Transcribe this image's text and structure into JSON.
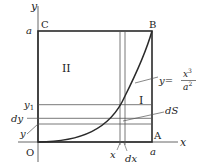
{
  "diagram": {
    "axes": {
      "x_label": "x",
      "y_label": "y",
      "origin_label": "O"
    },
    "points": {
      "A": "A",
      "B": "B",
      "C": "C"
    },
    "tick_labels": {
      "a_x": "a",
      "a_y": "a",
      "x": "x",
      "dx": "dx",
      "y1": "y",
      "y1_sub": "1",
      "dy": "dy",
      "y": "y"
    },
    "regions": {
      "region_1": "I",
      "region_2": "II"
    },
    "annotations": {
      "dS": "dS",
      "curve_lhs": "y=",
      "curve_num": "x",
      "curve_num_exp": "3",
      "curve_den": "a",
      "curve_den_exp": "2"
    },
    "colors": {
      "stroke": "#2a2a2a",
      "thin": "#555555",
      "text": "#222222"
    }
  }
}
